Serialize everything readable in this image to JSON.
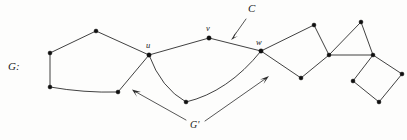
{
  "figure": {
    "title_label": "G:",
    "width": 407,
    "height": 140,
    "background_color": "#fdfdfc",
    "edge_color": "#2b2b2b",
    "node_color": "#101010",
    "labels": {
      "graph": "G:",
      "vertex_u": "u",
      "vertex_v": "v",
      "vertex_w": "w",
      "cycle": "C",
      "subgraph": "G'"
    },
    "label_positions": {
      "graph": {
        "x": 8,
        "y": 70
      },
      "vertex_u": {
        "x": 146,
        "y": 48
      },
      "vertex_v": {
        "x": 206,
        "y": 31
      },
      "vertex_w": {
        "x": 256,
        "y": 45
      },
      "cycle": {
        "x": 248,
        "y": 12
      },
      "subgraph": {
        "x": 190,
        "y": 128
      }
    },
    "nodes": [
      {
        "id": "p1",
        "name": "pentagon-top",
        "x": 96,
        "y": 31
      },
      {
        "id": "p2",
        "name": "pentagon-left-upper",
        "x": 50,
        "y": 53
      },
      {
        "id": "p3",
        "name": "pentagon-left-lower",
        "x": 50,
        "y": 87
      },
      {
        "id": "p4",
        "name": "pentagon-bottom-right",
        "x": 118,
        "y": 92
      },
      {
        "id": "u",
        "name": "vertex-u",
        "x": 149,
        "y": 55
      },
      {
        "id": "v",
        "name": "vertex-v",
        "x": 209,
        "y": 38
      },
      {
        "id": "w",
        "name": "vertex-w",
        "x": 261,
        "y": 51
      },
      {
        "id": "b1",
        "name": "lower-curve-vertex",
        "x": 186,
        "y": 102
      },
      {
        "id": "q1",
        "name": "quad-top",
        "x": 314,
        "y": 25
      },
      {
        "id": "q2",
        "name": "quad-right",
        "x": 329,
        "y": 55
      },
      {
        "id": "q3",
        "name": "quad-bottom",
        "x": 301,
        "y": 78
      },
      {
        "id": "t1",
        "name": "triangle-apex",
        "x": 361,
        "y": 22
      },
      {
        "id": "t2",
        "name": "triangle-right",
        "x": 373,
        "y": 55
      },
      {
        "id": "s1",
        "name": "square-left",
        "x": 353,
        "y": 81
      },
      {
        "id": "s2",
        "name": "square-right",
        "x": 402,
        "y": 74
      },
      {
        "id": "s3",
        "name": "square-bottom",
        "x": 379,
        "y": 102
      }
    ],
    "edges": [
      {
        "from": "p1",
        "to": "p2",
        "curved": false
      },
      {
        "from": "p2",
        "to": "p3",
        "curved": false
      },
      {
        "from": "p3",
        "to": "p4",
        "curved": true,
        "bow": 3
      },
      {
        "from": "p4",
        "to": "u",
        "curved": false
      },
      {
        "from": "p1",
        "to": "u",
        "curved": false
      },
      {
        "from": "u",
        "to": "v",
        "curved": false
      },
      {
        "from": "v",
        "to": "w",
        "curved": false
      },
      {
        "from": "u",
        "to": "b1",
        "curved": true,
        "bow": -7
      },
      {
        "from": "b1",
        "to": "w",
        "curved": true,
        "bow": -7
      },
      {
        "from": "w",
        "to": "q1",
        "curved": false
      },
      {
        "from": "q1",
        "to": "q2",
        "curved": false
      },
      {
        "from": "q2",
        "to": "q3",
        "curved": false
      },
      {
        "from": "q3",
        "to": "w",
        "curved": false
      },
      {
        "from": "q2",
        "to": "t1",
        "curved": false
      },
      {
        "from": "t1",
        "to": "t2",
        "curved": false
      },
      {
        "from": "t2",
        "to": "q2",
        "curved": false
      },
      {
        "from": "t2",
        "to": "s1",
        "curved": false
      },
      {
        "from": "t2",
        "to": "s2",
        "curved": false
      },
      {
        "from": "s1",
        "to": "s3",
        "curved": false
      },
      {
        "from": "s3",
        "to": "s2",
        "curved": false
      }
    ],
    "annotation_arrows": [
      {
        "name": "arrow-to-cycle-C",
        "from": {
          "x": 246,
          "y": 19
        },
        "to": {
          "x": 232,
          "y": 38
        }
      },
      {
        "name": "arrow-to-subgraph-left",
        "from": {
          "x": 186,
          "y": 120
        },
        "to": {
          "x": 133,
          "y": 90
        }
      },
      {
        "name": "arrow-to-subgraph-right",
        "from": {
          "x": 205,
          "y": 121
        },
        "to": {
          "x": 268,
          "y": 77
        }
      }
    ]
  }
}
